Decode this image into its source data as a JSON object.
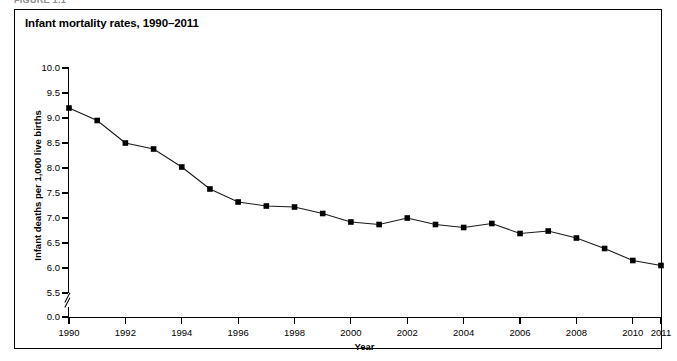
{
  "figure": {
    "caption_above": "FIGURE 1.1",
    "title": "Infant mortality rates, 1990–2011"
  },
  "axes": {
    "y_title": "Infant deaths per 1,000 live births",
    "x_title": "Year",
    "y_ticks": [
      "10.0",
      "9.5",
      "9.0",
      "8.5",
      "8.0",
      "7.5",
      "7.0",
      "6.5",
      "6.0",
      "5.5",
      "0.0"
    ],
    "x_ticks": [
      "1990",
      "1992",
      "1994",
      "1996",
      "1998",
      "2000",
      "2002",
      "2004",
      "2006",
      "2008",
      "2010",
      "2011"
    ],
    "axis_break": true
  },
  "colors": {
    "line": "#1a1a1a",
    "marker": "#000000",
    "axis": "#000000",
    "border": "#000000",
    "background": "#ffffff"
  },
  "chart_data": {
    "type": "line",
    "title": "Infant mortality rates, 1990–2011",
    "xlabel": "Year",
    "ylabel": "Infant deaths per 1,000 live births",
    "ylim": [
      5.5,
      10.0
    ],
    "xlim": [
      1990,
      2011
    ],
    "grid": false,
    "legend": null,
    "axis_break_below": 5.5,
    "x": [
      1990,
      1991,
      1992,
      1993,
      1994,
      1995,
      1996,
      1997,
      1998,
      1999,
      2000,
      2001,
      2002,
      2003,
      2004,
      2005,
      2006,
      2007,
      2008,
      2009,
      2010,
      2011
    ],
    "values": [
      9.2,
      8.95,
      8.5,
      8.38,
      8.02,
      7.58,
      7.32,
      7.24,
      7.22,
      7.09,
      6.92,
      6.87,
      7.0,
      6.87,
      6.81,
      6.89,
      6.69,
      6.74,
      6.6,
      6.39,
      6.15,
      6.05
    ],
    "categories": [
      "1990",
      "1991",
      "1992",
      "1993",
      "1994",
      "1995",
      "1996",
      "1997",
      "1998",
      "1999",
      "2000",
      "2001",
      "2002",
      "2003",
      "2004",
      "2005",
      "2006",
      "2007",
      "2008",
      "2009",
      "2010",
      "2011"
    ],
    "marker": "square",
    "ytick_values": [
      10.0,
      9.5,
      9.0,
      8.5,
      8.0,
      7.5,
      7.0,
      6.5,
      6.0,
      5.5,
      0.0
    ],
    "xtick_values": [
      1990,
      1992,
      1994,
      1996,
      1998,
      2000,
      2002,
      2004,
      2006,
      2008,
      2010,
      2011
    ]
  }
}
